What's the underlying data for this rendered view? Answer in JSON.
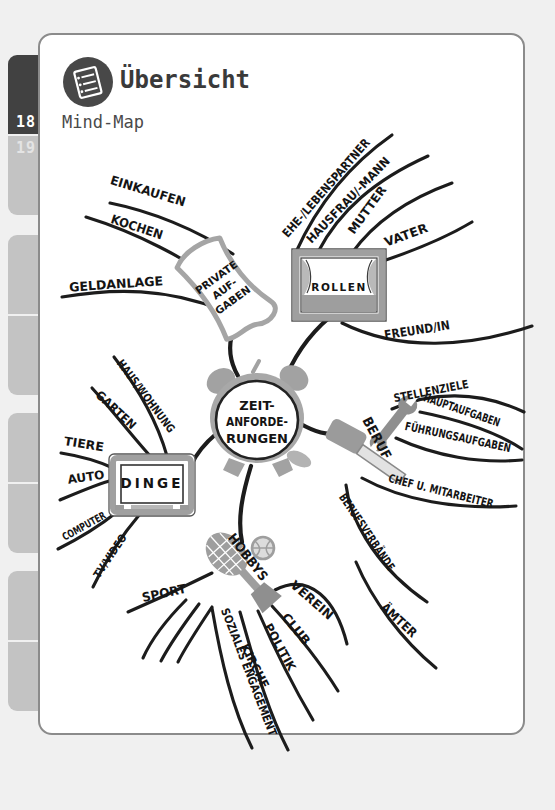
{
  "page": {
    "header": {
      "icon": "overview-notes-icon",
      "title": "Übersicht",
      "subtitle": "Mind-Map"
    },
    "tabs": {
      "current_page": "18",
      "next_page": "19"
    }
  },
  "mindmap": {
    "center": {
      "icon": "alarm-clock-icon",
      "lines": [
        "ZEIT-",
        "ANFORDE-",
        "RUNGEN"
      ]
    },
    "branches": [
      {
        "id": "private-aufgaben",
        "icon": "scroll-banner-icon",
        "node_lines": [
          "PRIVATE",
          "AUF-",
          "GABEN"
        ],
        "children": [
          "EINKAUFEN",
          "KOCHEN",
          "GELDANLAGE"
        ]
      },
      {
        "id": "rollen",
        "icon": "theater-stage-icon",
        "label": "ROLLEN",
        "children": [
          "EHE-/LEBENSPARTNER",
          "HAUSFRAU/-MANN",
          "MUTTER",
          "VATER",
          "FREUND/IN"
        ]
      },
      {
        "id": "beruf",
        "icon": "hammer-wrench-icon",
        "label": "BERUF",
        "children": [
          "STELLENZIELE",
          "HAUPTAUFGABEN",
          "FÜHRUNGSAUFGABEN",
          "CHEF U. MITARBEITER",
          "BERUFSVERBÄNDE",
          "ÄMTER"
        ]
      },
      {
        "id": "dinge",
        "icon": "tv-icon",
        "label": "DINGE",
        "children": [
          "HAUS/WOHNUNG",
          "GARTEN",
          "TIERE",
          "AUTO",
          "COMPUTER",
          "TV/VIDEO"
        ]
      },
      {
        "id": "hobbys",
        "icon": "tennis-racket-icon",
        "label": "HOBBYS",
        "children": [
          "SPORT",
          "VEREIN",
          "CLUB",
          "POLITIK",
          "KIRCHE",
          "SOZIALES ENGAGEMENT"
        ]
      }
    ]
  },
  "colors": {
    "background": "#f0f0f0",
    "card_border": "#8b8b8b",
    "tab_dark": "#414141",
    "tab_gray": "#c3c3c3",
    "ink": "#1c1c1c",
    "sketch_gray": "#a2a2a2"
  }
}
